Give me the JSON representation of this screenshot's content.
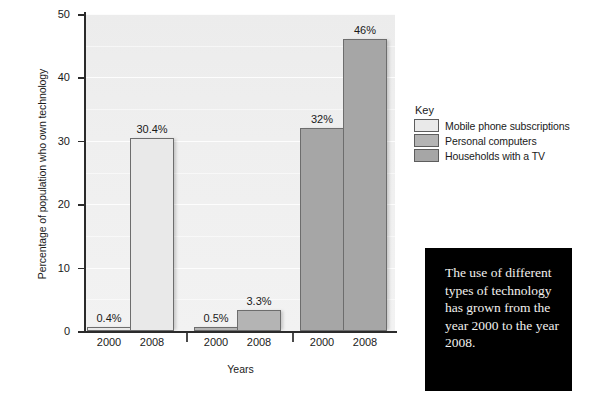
{
  "chart_data": {
    "type": "bar",
    "title": "",
    "xlabel": "Years",
    "ylabel": "Percentage of population who own technology",
    "ylim": [
      0,
      50
    ],
    "yticks": [
      0,
      10,
      20,
      30,
      40,
      50
    ],
    "ytick_labels": [
      "0",
      "10",
      "20",
      "30",
      "40",
      "50"
    ],
    "grid": true,
    "grid_axis": "y",
    "legend_position": "right",
    "categories": [
      "2000",
      "2008"
    ],
    "series": [
      {
        "name": "Mobile phone subscriptions",
        "color": "#e9e9e9",
        "categories": [
          "2000",
          "2008"
        ],
        "values": [
          0.4,
          30.4
        ],
        "data_labels": [
          "0.4%",
          "30.4%"
        ]
      },
      {
        "name": "Personal computers",
        "color": "#b4b4b4",
        "categories": [
          "2000",
          "2008"
        ],
        "values": [
          0.5,
          3.3
        ],
        "data_labels": [
          "0.5%",
          "3.3%"
        ]
      },
      {
        "name": "Households with a TV",
        "color": "#a6a6a6",
        "categories": [
          "2000",
          "2008"
        ],
        "values": [
          32,
          46
        ],
        "data_labels": [
          "32%",
          "46%"
        ]
      }
    ],
    "bars": [
      {
        "label": "2000",
        "value": 0.4,
        "data_label": "0.4%",
        "series": "Mobile phone subscriptions",
        "color": "#e9e9e9"
      },
      {
        "label": "2008",
        "value": 30.4,
        "data_label": "30.4%",
        "series": "Mobile phone subscriptions",
        "color": "#e9e9e9"
      },
      {
        "label": "2000",
        "value": 0.5,
        "data_label": "0.5%",
        "series": "Personal computers",
        "color": "#b4b4b4"
      },
      {
        "label": "2008",
        "value": 3.3,
        "data_label": "3.3%",
        "series": "Personal computers",
        "color": "#b4b4b4"
      },
      {
        "label": "2000",
        "value": 32,
        "data_label": "32%",
        "series": "Households with a TV",
        "color": "#a6a6a6"
      },
      {
        "label": "2008",
        "value": 46,
        "data_label": "46%",
        "series": "Households with a TV",
        "color": "#a6a6a6"
      }
    ]
  },
  "legend": {
    "title": "Key",
    "items": [
      {
        "label": "Mobile phone subscriptions",
        "color": "#e9e9e9"
      },
      {
        "label": "Personal computers",
        "color": "#b4b4b4"
      },
      {
        "label": "Households with a TV",
        "color": "#a6a6a6"
      }
    ]
  },
  "callout": {
    "text": "The use of different types of technology has grown from the year 2000 to the year 2008.",
    "background": "#000000",
    "text_color": "#f2f0ee"
  },
  "axis": {
    "y_title": "Percentage of population who own technology",
    "x_title": "Years",
    "y_tick_labels": [
      "50",
      "40",
      "30",
      "20",
      "10",
      "0"
    ],
    "x_tick_labels": [
      "2000",
      "2008",
      "2000",
      "2008",
      "2000",
      "2008"
    ]
  }
}
